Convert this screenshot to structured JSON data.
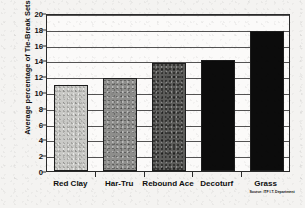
{
  "chart_data": {
    "type": "bar",
    "title": "",
    "subtitle": "",
    "xlabel": "",
    "ylabel": "Average percentage of Tie-Break Sets",
    "categories": [
      "Red Clay",
      "Har-Tru",
      "Rebound Ace",
      "Decoturf",
      "Grass"
    ],
    "values": [
      10.9,
      11.8,
      13.7,
      14.0,
      17.7
    ],
    "bar_colors": [
      "#c9c9c6",
      "#8e8e8c",
      "#5c5c5a",
      "#0c0c0c",
      "#0c0c0c"
    ],
    "bar_fill_names": [
      "light-gray-texture",
      "medium-gray-texture",
      "dark-gray-texture",
      "black",
      "black"
    ],
    "ylim": [
      0,
      20
    ],
    "ytick_step": 2,
    "ytick_labels": [
      "0",
      "2",
      "4",
      "6",
      "8",
      "10",
      "12",
      "14",
      "16",
      "18",
      "20"
    ],
    "grid": true,
    "grid_axis": "y",
    "legend": false,
    "legend_position": "none",
    "annotations": [
      {
        "name": "source-note",
        "text": "Source: ITF I.T. Department",
        "anchor": "Grass"
      }
    ]
  },
  "figure": {
    "background_color": "#f4f3f1",
    "plot_background_color": "#fbfaf9",
    "axis_color": "#2a2a2a",
    "text_color": "#101010"
  }
}
